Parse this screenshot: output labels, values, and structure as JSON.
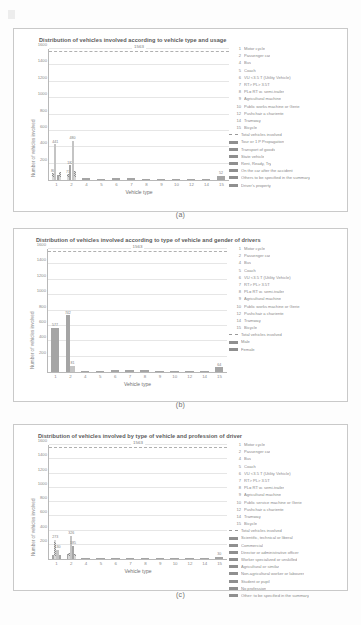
{
  "page": {
    "captions": {
      "a": "(a)",
      "b": "(b)",
      "c": "(c)"
    }
  },
  "chart_data": [
    {
      "id": "a",
      "type": "bar",
      "title": "Distribution of vehicles involved according to vehicle type and usage",
      "xlabel": "Vehicle type",
      "ylabel": "Number of vehicles involved",
      "ylim": [
        0,
        1600
      ],
      "yticks": [
        200,
        400,
        600,
        800,
        1000,
        1200,
        1400,
        1600
      ],
      "ytick_labels": [
        "200",
        "400",
        "600",
        "800",
        "1000",
        "1200",
        "1400",
        "1600"
      ],
      "categories": [
        "1",
        "2",
        "4",
        "5",
        "6",
        "7",
        "8",
        "9",
        "10",
        "12",
        "14",
        "15"
      ],
      "xtick_labels": [
        "1",
        "2",
        "4",
        "5",
        "6",
        "7",
        "8",
        "9",
        "10",
        "12",
        "14",
        "15"
      ],
      "grid": true,
      "total_line": {
        "value": 1563,
        "label": "1563",
        "style": "dashed"
      },
      "legend_position": "right",
      "numbered_legend": [
        {
          "key": "1",
          "label": "Motor cycle"
        },
        {
          "key": "2",
          "label": "Passenger car"
        },
        {
          "key": "4",
          "label": "Bus"
        },
        {
          "key": "5",
          "label": "Coach"
        },
        {
          "key": "6",
          "label": "VU <3.5 T (Utility Vehicle)"
        },
        {
          "key": "7",
          "label": "RT> PL> 3.5T"
        },
        {
          "key": "8",
          "label": "PL= RT w. semi-trailer"
        },
        {
          "key": "9",
          "label": "Agricultural machine"
        },
        {
          "key": "10",
          "label": "Public works machine or Gerie"
        },
        {
          "key": "12",
          "label": "Pushchair a chariente"
        },
        {
          "key": "14",
          "label": "Tramway"
        },
        {
          "key": "15",
          "label": "Bicycle"
        }
      ],
      "series": [
        {
          "name": "Total vehicles involved",
          "swatch": "dash"
        },
        {
          "name": "Tour or 1 P Propagation",
          "swatch": "solid"
        },
        {
          "name": "Transport of goods",
          "swatch": "solid"
        },
        {
          "name": "State vehicle",
          "swatch": "solid"
        },
        {
          "name": "Rent, Ready, Try",
          "swatch": "solid"
        },
        {
          "name": "On the car after the accident",
          "swatch": "solid"
        },
        {
          "name": "Others to be specified in the summary",
          "swatch": "solid"
        },
        {
          "name": "Driver's property",
          "swatch": "solid"
        }
      ],
      "bars": [
        {
          "cat": "1",
          "value": 80,
          "label": "80",
          "style": "hatch"
        },
        {
          "cat": "1",
          "value": 441,
          "label": "441",
          "style": "lite"
        },
        {
          "cat": "1",
          "value": 60,
          "label": "",
          "style": "dots"
        },
        {
          "cat": "1",
          "value": 96,
          "label": "",
          "style": "hatch"
        },
        {
          "cat": "2",
          "value": 71,
          "label": "71",
          "style": "hatch"
        },
        {
          "cat": "2",
          "value": 182,
          "label": "182",
          "style": "dots"
        },
        {
          "cat": "2",
          "value": 480,
          "label": "480",
          "style": "lite"
        },
        {
          "cat": "2",
          "value": 110,
          "label": "",
          "style": "hatch"
        },
        {
          "cat": "4",
          "value": 22,
          "label": "",
          "style": "dots"
        },
        {
          "cat": "5",
          "value": 18,
          "label": "",
          "style": "dots"
        },
        {
          "cat": "6",
          "value": 25,
          "label": "",
          "style": "dots"
        },
        {
          "cat": "7",
          "value": 20,
          "label": "",
          "style": "dots"
        },
        {
          "cat": "8",
          "value": 16,
          "label": "",
          "style": "dots"
        },
        {
          "cat": "9",
          "value": 14,
          "label": "",
          "style": "dots"
        },
        {
          "cat": "10",
          "value": 12,
          "label": "",
          "style": "dots"
        },
        {
          "cat": "12",
          "value": 10,
          "label": "",
          "style": "dots"
        },
        {
          "cat": "14",
          "value": 9,
          "label": "",
          "style": "dots"
        },
        {
          "cat": "15",
          "value": 52,
          "label": "52",
          "style": "dots"
        }
      ]
    },
    {
      "id": "b",
      "type": "bar",
      "title": "Distribution of vehicles involved according to type of vehicle and gender of drivers",
      "xlabel": "Vehicle type",
      "ylabel": "Number of vehicles involved",
      "ylim": [
        0,
        1600
      ],
      "yticks": [
        200,
        400,
        600,
        800,
        1000,
        1200,
        1400,
        1600
      ],
      "ytick_labels": [
        "200",
        "400",
        "600",
        "800",
        "1000",
        "1200",
        "1400",
        "1600"
      ],
      "categories": [
        "1",
        "2",
        "4",
        "5",
        "6",
        "7",
        "8",
        "9",
        "10",
        "12",
        "14",
        "15"
      ],
      "xtick_labels": [
        "1",
        "2",
        "4",
        "5",
        "6",
        "7",
        "8",
        "9",
        "10",
        "12",
        "14",
        "15"
      ],
      "grid": true,
      "total_line": {
        "value": 1563,
        "label": "1563",
        "style": "dashed"
      },
      "legend_position": "right",
      "numbered_legend": [
        {
          "key": "1",
          "label": "Motor cycle"
        },
        {
          "key": "2",
          "label": "Passenger car"
        },
        {
          "key": "4",
          "label": "Bus"
        },
        {
          "key": "5",
          "label": "Coach"
        },
        {
          "key": "6",
          "label": "VU <3.5 T (Utility Vehicle)"
        },
        {
          "key": "7",
          "label": "RT> PL> 3.5T"
        },
        {
          "key": "8",
          "label": "PL= RT w. semi-trailer"
        },
        {
          "key": "9",
          "label": "Agricultural machine"
        },
        {
          "key": "10",
          "label": "Public works machine or Gerie"
        },
        {
          "key": "12",
          "label": "Pushchair a chariente"
        },
        {
          "key": "14",
          "label": "Tramway"
        },
        {
          "key": "15",
          "label": "Bicycle"
        }
      ],
      "series": [
        {
          "name": "Total vehicles involved",
          "swatch": "dash"
        },
        {
          "name": "Male",
          "swatch": "solid"
        },
        {
          "name": "Female",
          "swatch": "solid"
        }
      ],
      "bars": [
        {
          "cat": "1",
          "value": 577,
          "label": "577",
          "style": "dots"
        },
        {
          "cat": "2",
          "value": 742,
          "label": "742",
          "style": "dots"
        },
        {
          "cat": "2",
          "value": 81,
          "label": "81",
          "style": "lite"
        },
        {
          "cat": "4",
          "value": 14,
          "label": "",
          "style": "dots"
        },
        {
          "cat": "5",
          "value": 12,
          "label": "",
          "style": "dots"
        },
        {
          "cat": "6",
          "value": 26,
          "label": "",
          "style": "dots"
        },
        {
          "cat": "7",
          "value": 24,
          "label": "",
          "style": "dots"
        },
        {
          "cat": "8",
          "value": 22,
          "label": "",
          "style": "dots"
        },
        {
          "cat": "9",
          "value": 10,
          "label": "",
          "style": "dots"
        },
        {
          "cat": "10",
          "value": 9,
          "label": "",
          "style": "dots"
        },
        {
          "cat": "12",
          "value": 8,
          "label": "",
          "style": "dots"
        },
        {
          "cat": "14",
          "value": 8,
          "label": "",
          "style": "dots"
        },
        {
          "cat": "15",
          "value": 64,
          "label": "64",
          "style": "dots"
        }
      ]
    },
    {
      "id": "c",
      "type": "bar",
      "title": "Distribution of vehicles involved by type of vehicle and profession of driver",
      "xlabel": "Vehicle type",
      "ylabel": "Number of vehicles involved",
      "ylim": [
        0,
        1600
      ],
      "yticks": [
        200,
        400,
        600,
        800,
        1000,
        1200,
        1400,
        1600
      ],
      "ytick_labels": [
        "200",
        "400",
        "600",
        "800",
        "1000",
        "1200",
        "1400",
        "1600"
      ],
      "categories": [
        "1",
        "2",
        "4",
        "5",
        "6",
        "7",
        "8",
        "9",
        "10",
        "12",
        "14",
        "15"
      ],
      "xtick_labels": [
        "1",
        "2",
        "4",
        "5",
        "6",
        "7",
        "8",
        "9",
        "10",
        "12",
        "14",
        "15"
      ],
      "grid": true,
      "total_line": {
        "value": 1563,
        "label": "1563",
        "style": "dashed"
      },
      "legend_position": "right",
      "numbered_legend": [
        {
          "key": "1",
          "label": "Motor cycle"
        },
        {
          "key": "2",
          "label": "Passenger car"
        },
        {
          "key": "4",
          "label": "Bus"
        },
        {
          "key": "5",
          "label": "Coach"
        },
        {
          "key": "6",
          "label": "VU <3.5 T (Utility Vehicle)"
        },
        {
          "key": "7",
          "label": "RT> PL> 3.5T"
        },
        {
          "key": "8",
          "label": "PL= RT w. semi-trailer"
        },
        {
          "key": "9",
          "label": "Agricultural machine"
        },
        {
          "key": "10",
          "label": "Public service machine or Gerie"
        },
        {
          "key": "12",
          "label": "Pushchair a chariente"
        },
        {
          "key": "14",
          "label": "Tramway"
        },
        {
          "key": "15",
          "label": "Bicycle"
        }
      ],
      "series": [
        {
          "name": "Total vehicles involved",
          "swatch": "dash"
        },
        {
          "name": "Scientific, technical or liberal",
          "swatch": "solid"
        },
        {
          "name": "Commercial",
          "swatch": "solid"
        },
        {
          "name": "Director or administrative officer",
          "swatch": "solid"
        },
        {
          "name": "Worker specialized or unskilled",
          "swatch": "solid"
        },
        {
          "name": "Agricultural or similar",
          "swatch": "solid"
        },
        {
          "name": "Non-agricultural worker or labourer",
          "swatch": "solid"
        },
        {
          "name": "Student or pupil",
          "swatch": "solid"
        },
        {
          "name": "No profession",
          "swatch": "solid"
        },
        {
          "name": "Other: to be specified in the summary",
          "swatch": "solid"
        }
      ],
      "bars": [
        {
          "cat": "1",
          "value": 55,
          "label": "",
          "style": "dots"
        },
        {
          "cat": "1",
          "value": 273,
          "label": "273",
          "style": "hatch"
        },
        {
          "cat": "1",
          "value": 130,
          "label": "130",
          "style": "lite"
        },
        {
          "cat": "1",
          "value": 62,
          "label": "",
          "style": "dots"
        },
        {
          "cat": "2",
          "value": 70,
          "label": "",
          "style": "dots"
        },
        {
          "cat": "2",
          "value": 90,
          "label": "",
          "style": "hatch"
        },
        {
          "cat": "2",
          "value": 326,
          "label": "326",
          "style": "lite"
        },
        {
          "cat": "2",
          "value": 185,
          "label": "185",
          "style": "dots"
        },
        {
          "cat": "2",
          "value": 64,
          "label": "",
          "style": "hatch"
        },
        {
          "cat": "4",
          "value": 14,
          "label": "",
          "style": "dots"
        },
        {
          "cat": "5",
          "value": 12,
          "label": "",
          "style": "dots"
        },
        {
          "cat": "6",
          "value": 16,
          "label": "",
          "style": "dots"
        },
        {
          "cat": "7",
          "value": 14,
          "label": "",
          "style": "dots"
        },
        {
          "cat": "8",
          "value": 12,
          "label": "",
          "style": "dots"
        },
        {
          "cat": "9",
          "value": 10,
          "label": "",
          "style": "dots"
        },
        {
          "cat": "10",
          "value": 9,
          "label": "",
          "style": "dots"
        },
        {
          "cat": "12",
          "value": 8,
          "label": "",
          "style": "dots"
        },
        {
          "cat": "14",
          "value": 8,
          "label": "",
          "style": "dots"
        },
        {
          "cat": "15",
          "value": 30,
          "label": "30",
          "style": "dots"
        }
      ]
    }
  ]
}
